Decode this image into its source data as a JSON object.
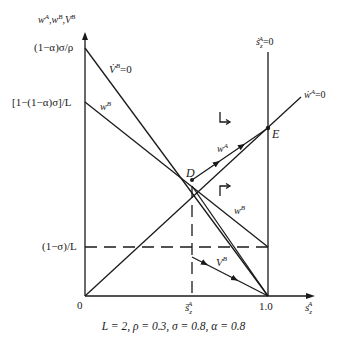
{
  "diagram": {
    "y_axis_label": "w^A, w^B, V^B",
    "x_axis_label": "s_z^A",
    "y_ticks": [
      {
        "label": "(1−α)σ/ρ",
        "value": 1.5
      },
      {
        "label": "[1−(1−α)σ]/L",
        "value": 0.42
      },
      {
        "label": "(1−σ)/L",
        "value": 0.1
      }
    ],
    "x_ticks": [
      {
        "label": "0",
        "value": 0
      },
      {
        "label": "s̄_z^A",
        "value": 0.59
      },
      {
        "label": "1.0",
        "value": 1.0
      }
    ],
    "curve_labels": {
      "vdot_b_zero": "V̇^B = 0",
      "w_b_upper": "w^B",
      "w_b_lower": "w^B",
      "w_a": "w^A",
      "v_b": "V^B",
      "wdot_a_zero": "ẇ^A = 0",
      "sdot_zero": "ṡ_z^A = 0"
    },
    "points": {
      "D": "D",
      "E": "E"
    },
    "caption": "L = 2, ρ = 0.3, σ = 0.8, α = 0.8"
  },
  "text": {
    "ylabel_w": "w",
    "ylabel_A": "A",
    "ylabel_comma1": ",",
    "ylabel_B": "B",
    "ylabel_comma2": ",",
    "ylabel_V": "V",
    "ylabel_B2": "B",
    "tick_top": "(1−α)σ/ρ",
    "tick_mid": "[1−(1−α)σ]/L",
    "tick_low": "(1−σ)/L",
    "origin": "0",
    "x_sbar": "s̄",
    "x_sbar_sup": "A",
    "x_sbar_sub": "z",
    "x_one": "1.0",
    "x_axis_s": "s",
    "x_axis_sup": "A",
    "x_axis_sub": "z",
    "sdot_s": "ṡ",
    "sdot_sup": "A",
    "sdot_sub": "z",
    "sdot_eq": "=0",
    "vdot_V": "V̇",
    "vdot_sup": "B",
    "vdot_eq": "=0",
    "wdot_w": "ẇ",
    "wdot_sup": "A",
    "wdot_eq": "=0",
    "wB1": "w",
    "wB1_sup": "B",
    "wB2": "w",
    "wB2_sup": "B",
    "wA": "w",
    "wA_sup": "A",
    "VB": "V",
    "VB_sup": "B",
    "D": "D",
    "E": "E",
    "caption": "L = 2, ρ = 0.3, σ = 0.8, α = 0.8"
  }
}
